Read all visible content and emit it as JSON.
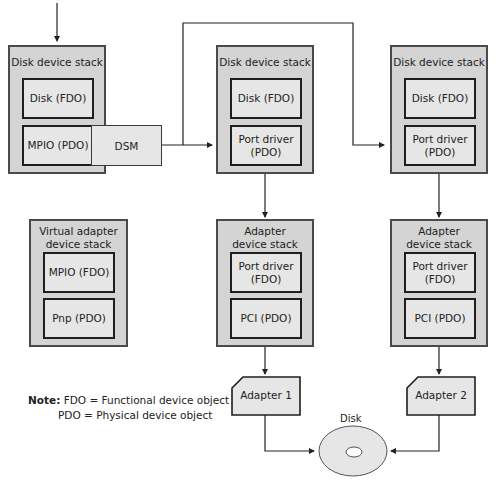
{
  "stacks": {
    "mpio_disk": {
      "title": "Disk device stack",
      "upper": "Disk (FDO)",
      "lower": "MPIO (PDO)",
      "dsm": "DSM"
    },
    "disk_stack_1": {
      "title": "Disk device stack",
      "upper": "Disk (FDO)",
      "lower_line1": "Port driver",
      "lower_line2": "(PDO)"
    },
    "disk_stack_2": {
      "title": "Disk device stack",
      "upper": "Disk (FDO)",
      "lower_line1": "Port driver",
      "lower_line2": "(PDO)"
    },
    "virtual_adapter": {
      "title_line1": "Virtual adapter",
      "title_line2": "device stack",
      "upper": "MPIO (FDO)",
      "lower": "Pnp (PDO)"
    },
    "adapter_stack_1": {
      "title_line1": "Adapter",
      "title_line2": "device stack",
      "upper_line1": "Port driver",
      "upper_line2": "(FDO)",
      "lower": "PCI (PDO)"
    },
    "adapter_stack_2": {
      "title_line1": "Adapter",
      "title_line2": "device stack",
      "upper_line1": "Port driver",
      "upper_line2": "(FDO)",
      "lower": "PCI (PDO)"
    }
  },
  "adapters": {
    "adapter1": "Adapter 1",
    "adapter2": "Adapter 2"
  },
  "disk": {
    "label": "Disk"
  },
  "note": {
    "prefix": "Note:",
    "line1": "FDO = Functional device object",
    "line2": "PDO = Physical device object"
  },
  "colors": {
    "stack_fill": "#d4d4d4",
    "object_fill": "#e6e6e6",
    "border": "#1e1e1e",
    "line": "#222222"
  }
}
